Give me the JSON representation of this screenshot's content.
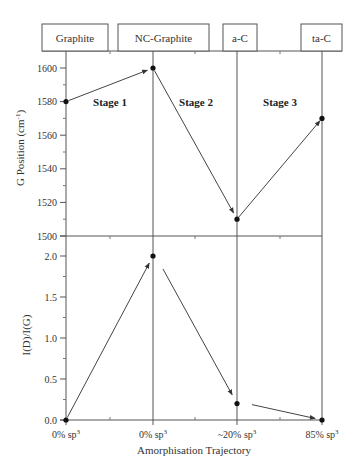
{
  "chart_data": {
    "type": "line",
    "title": "",
    "phases": [
      "Graphite",
      "NC-Graphite",
      "a-C",
      "ta-C"
    ],
    "categories": [
      "0% sp3",
      "0% sp3",
      "~20% sp3",
      "85% sp3"
    ],
    "category_labels": [
      {
        "base": "0% sp",
        "sup": "3"
      },
      {
        "base": "0% sp",
        "sup": "3"
      },
      {
        "base": "~20% sp",
        "sup": "3"
      },
      {
        "base": "85% sp",
        "sup": "3"
      }
    ],
    "xlabel": "Amorphisation Trajectory",
    "stages": [
      "Stage 1",
      "Stage 2",
      "Stage 3"
    ],
    "panels": [
      {
        "name": "G Position",
        "ylabel": "G Position (cm",
        "ylabel_sup": "-1",
        "ylabel_close": ")",
        "ylim": [
          1500,
          1610
        ],
        "yticks": [
          1500,
          1520,
          1540,
          1560,
          1580,
          1600
        ],
        "yticklabels": [
          "1500",
          "1520",
          "1540",
          "1560",
          "1580",
          "1600"
        ],
        "values": [
          1580,
          1600,
          1510,
          1570
        ]
      },
      {
        "name": "I(D)/I(G)",
        "ylabel": "I(D)/I(G)",
        "ylim": [
          0.0,
          2.0
        ],
        "yticks": [
          0.0,
          0.5,
          1.0,
          1.5,
          2.0
        ],
        "yticklabels": [
          "0.0",
          "0.5",
          "1.0",
          "1.5",
          "2.0"
        ],
        "values": [
          0.0,
          2.0,
          0.2,
          0.0
        ]
      }
    ],
    "grid": false,
    "legend": null
  },
  "colors": {
    "line": "#444444",
    "marker": "#111111",
    "box_border": "#555555"
  }
}
